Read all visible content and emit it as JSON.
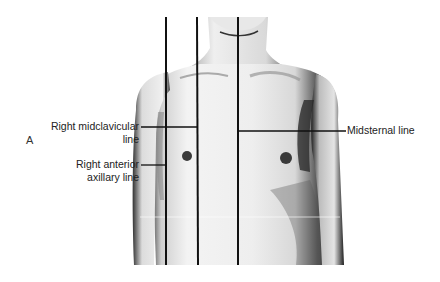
{
  "figure": {
    "panel_letter": "A",
    "labels": {
      "right_midclavicular": [
        "Right midclavicular",
        "line"
      ],
      "right_anterior_axillary": [
        "Right anterior",
        "axillary line"
      ],
      "midsternal": "Midsternal line"
    },
    "colors": {
      "line": "#111111",
      "skin_light": "#f2f2f2",
      "skin_shadow": "#4a4a4a",
      "background": "#ffffff"
    }
  }
}
